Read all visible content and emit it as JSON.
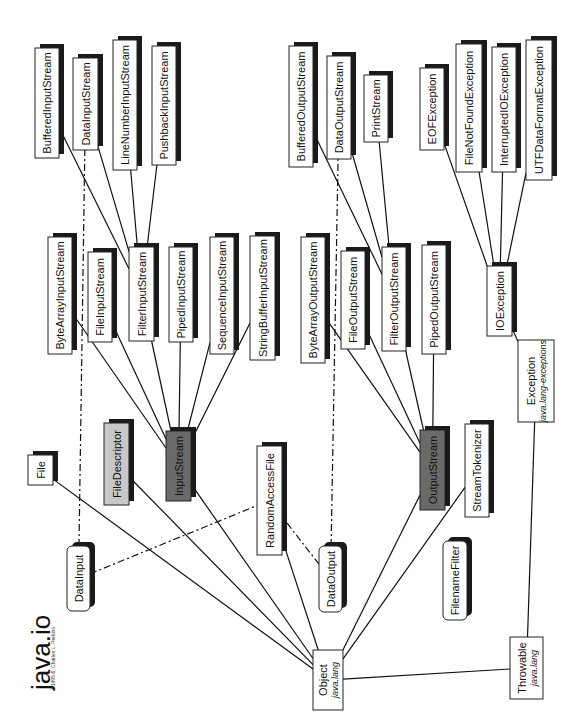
{
  "title": "java.io",
  "copyright": "©1995-6, Charles L. Perkins",
  "colors": {
    "abstract_fill": "#6a6a6a",
    "final_fill": "#c8c8c8",
    "class_fill": "#ffffff",
    "shadow": "#1a1a1a",
    "line": "#111111"
  },
  "nodes": [
    {
      "id": "Object",
      "label": "Object",
      "sub": "java.lang",
      "style": "plain"
    },
    {
      "id": "Throwable",
      "label": "Throwable",
      "sub": "java.lang",
      "style": "plain"
    },
    {
      "id": "Exception",
      "label": "Exception",
      "sub": "java.lang-exceptions",
      "style": "plain"
    },
    {
      "id": "IOException",
      "label": "IOException",
      "style": "class"
    },
    {
      "id": "EOFException",
      "label": "EOFException",
      "style": "class"
    },
    {
      "id": "FileNotFoundException",
      "label": "FileNotFoundException",
      "style": "class"
    },
    {
      "id": "InterruptedIOException",
      "label": "InterruptedIOException",
      "style": "class"
    },
    {
      "id": "UTFDataFormatException",
      "label": "UTFDataFormatException",
      "style": "class"
    },
    {
      "id": "File",
      "label": "File",
      "style": "class"
    },
    {
      "id": "FileDescriptor",
      "label": "FileDescriptor",
      "style": "final"
    },
    {
      "id": "InputStream",
      "label": "InputStream",
      "style": "abstract"
    },
    {
      "id": "OutputStream",
      "label": "OutputStream",
      "style": "abstract"
    },
    {
      "id": "RandomAccessFile",
      "label": "RandomAccessFile",
      "style": "class"
    },
    {
      "id": "StreamTokenizer",
      "label": "StreamTokenizer",
      "style": "class"
    },
    {
      "id": "DataInput",
      "label": "DataInput",
      "style": "interface"
    },
    {
      "id": "DataOutput",
      "label": "DataOutput",
      "style": "interface"
    },
    {
      "id": "FilenameFilter",
      "label": "FilenameFilter",
      "style": "interface"
    },
    {
      "id": "ByteArrayInputStream",
      "label": "ByteArrayInputStream",
      "style": "class"
    },
    {
      "id": "FileInputStream",
      "label": "FileInputStream",
      "style": "class"
    },
    {
      "id": "FilterInputStream",
      "label": "FilterInputStream",
      "style": "class"
    },
    {
      "id": "PipedInputStream",
      "label": "PipedInputStream",
      "style": "class"
    },
    {
      "id": "SequenceInputStream",
      "label": "SequenceInputStream",
      "style": "class"
    },
    {
      "id": "StringBufferInputStream",
      "label": "StringBufferInputStream",
      "style": "class"
    },
    {
      "id": "BufferedInputStream",
      "label": "BufferedInputStream",
      "style": "class"
    },
    {
      "id": "DataInputStream",
      "label": "DataInputStream",
      "style": "class"
    },
    {
      "id": "LineNumberInputStream",
      "label": "LineNumberInputStream",
      "style": "class"
    },
    {
      "id": "PushbackInputStream",
      "label": "PushbackInputStream",
      "style": "class"
    },
    {
      "id": "ByteArrayOutputStream",
      "label": "ByteArrayOutputStream",
      "style": "class"
    },
    {
      "id": "FileOutputStream",
      "label": "FileOutputStream",
      "style": "class"
    },
    {
      "id": "FilterOutputStream",
      "label": "FilterOutputStream",
      "style": "class"
    },
    {
      "id": "PipedOutputStream",
      "label": "PipedOutputStream",
      "style": "class"
    },
    {
      "id": "BufferedOutputStream",
      "label": "BufferedOutputStream",
      "style": "class"
    },
    {
      "id": "DataOutputStream",
      "label": "DataOutputStream",
      "style": "class"
    },
    {
      "id": "PrintStream",
      "label": "PrintStream",
      "style": "class"
    }
  ],
  "edges": [
    {
      "from": "Object",
      "to": "File",
      "kind": "extends"
    },
    {
      "from": "Object",
      "to": "FileDescriptor",
      "kind": "extends"
    },
    {
      "from": "Object",
      "to": "InputStream",
      "kind": "extends"
    },
    {
      "from": "Object",
      "to": "RandomAccessFile",
      "kind": "extends"
    },
    {
      "from": "Object",
      "to": "OutputStream",
      "kind": "extends"
    },
    {
      "from": "Object",
      "to": "StreamTokenizer",
      "kind": "extends"
    },
    {
      "from": "Object",
      "to": "Throwable",
      "kind": "extends"
    },
    {
      "from": "Throwable",
      "to": "Exception",
      "kind": "extends"
    },
    {
      "from": "Exception",
      "to": "IOException",
      "kind": "extends"
    },
    {
      "from": "IOException",
      "to": "EOFException",
      "kind": "extends"
    },
    {
      "from": "IOException",
      "to": "FileNotFoundException",
      "kind": "extends"
    },
    {
      "from": "IOException",
      "to": "InterruptedIOException",
      "kind": "extends"
    },
    {
      "from": "IOException",
      "to": "UTFDataFormatException",
      "kind": "extends"
    },
    {
      "from": "InputStream",
      "to": "ByteArrayInputStream",
      "kind": "extends"
    },
    {
      "from": "InputStream",
      "to": "FileInputStream",
      "kind": "extends"
    },
    {
      "from": "InputStream",
      "to": "FilterInputStream",
      "kind": "extends"
    },
    {
      "from": "InputStream",
      "to": "PipedInputStream",
      "kind": "extends"
    },
    {
      "from": "InputStream",
      "to": "SequenceInputStream",
      "kind": "extends"
    },
    {
      "from": "InputStream",
      "to": "StringBufferInputStream",
      "kind": "extends"
    },
    {
      "from": "FilterInputStream",
      "to": "BufferedInputStream",
      "kind": "extends"
    },
    {
      "from": "FilterInputStream",
      "to": "DataInputStream",
      "kind": "extends"
    },
    {
      "from": "FilterInputStream",
      "to": "LineNumberInputStream",
      "kind": "extends"
    },
    {
      "from": "FilterInputStream",
      "to": "PushbackInputStream",
      "kind": "extends"
    },
    {
      "from": "OutputStream",
      "to": "ByteArrayOutputStream",
      "kind": "extends"
    },
    {
      "from": "OutputStream",
      "to": "FileOutputStream",
      "kind": "extends"
    },
    {
      "from": "OutputStream",
      "to": "FilterOutputStream",
      "kind": "extends"
    },
    {
      "from": "OutputStream",
      "to": "PipedOutputStream",
      "kind": "extends"
    },
    {
      "from": "FilterOutputStream",
      "to": "BufferedOutputStream",
      "kind": "extends"
    },
    {
      "from": "FilterOutputStream",
      "to": "DataOutputStream",
      "kind": "extends"
    },
    {
      "from": "FilterOutputStream",
      "to": "PrintStream",
      "kind": "extends"
    },
    {
      "from": "DataInput",
      "to": "DataInputStream",
      "kind": "implements"
    },
    {
      "from": "DataInput",
      "to": "RandomAccessFile",
      "kind": "implements"
    },
    {
      "from": "DataOutput",
      "to": "RandomAccessFile",
      "kind": "implements"
    },
    {
      "from": "DataOutput",
      "to": "DataOutputStream",
      "kind": "implements"
    }
  ]
}
